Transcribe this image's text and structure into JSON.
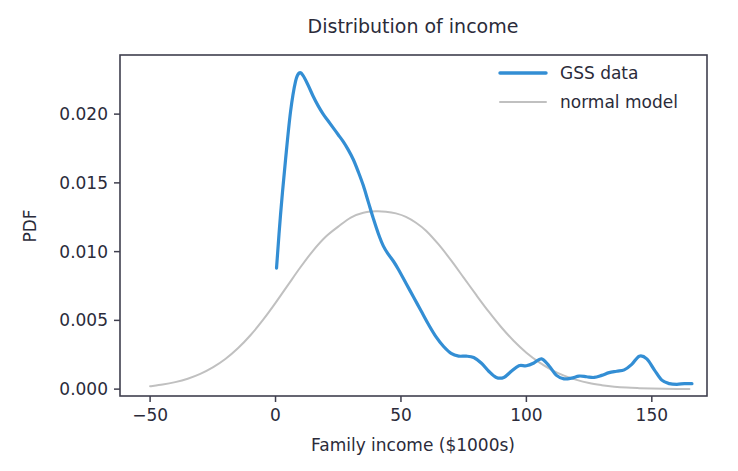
{
  "chart_data": {
    "type": "line",
    "title": "Distribution of income",
    "xlabel": "Family income ($1000s)",
    "ylabel": "PDF",
    "xlim": [
      -62,
      172
    ],
    "ylim": [
      -0.0005,
      0.0243
    ],
    "xticks": [
      -50,
      0,
      50,
      100,
      150
    ],
    "xticklabels": [
      "−50",
      "0",
      "50",
      "100",
      "150"
    ],
    "yticks": [
      0.0,
      0.005,
      0.01,
      0.015,
      0.02
    ],
    "yticklabels": [
      "0.000",
      "0.005",
      "0.010",
      "0.015",
      "0.020"
    ],
    "grid": false,
    "legend_position": "upper right",
    "series": [
      {
        "name": "GSS data",
        "color": "#338ed4",
        "linewidth": 3.2,
        "x": [
          0.4,
          2,
          4,
          6,
          8,
          9.5,
          11,
          13,
          15,
          17,
          19,
          21,
          23,
          25,
          27,
          29,
          31,
          33,
          35,
          37,
          39,
          41,
          43,
          45,
          47,
          49,
          52,
          55,
          58,
          61,
          64,
          67,
          70,
          73,
          76,
          79,
          82,
          85,
          88,
          91,
          94,
          97,
          100,
          103,
          106,
          109,
          112,
          115,
          118,
          121,
          124,
          127,
          130,
          133,
          136,
          139,
          142,
          145,
          148,
          151,
          154,
          157,
          160,
          163,
          166
        ],
        "y": [
          0.0088,
          0.0127,
          0.0167,
          0.0202,
          0.0224,
          0.023,
          0.0228,
          0.0221,
          0.0213,
          0.0206,
          0.02,
          0.0195,
          0.019,
          0.0185,
          0.018,
          0.0174,
          0.0167,
          0.0158,
          0.0148,
          0.0136,
          0.0124,
          0.0113,
          0.0104,
          0.0098,
          0.0093,
          0.0087,
          0.0077,
          0.0067,
          0.0057,
          0.0047,
          0.0038,
          0.0031,
          0.0026,
          0.0024,
          0.0024,
          0.0023,
          0.0019,
          0.0013,
          0.00085,
          0.00085,
          0.0013,
          0.0017,
          0.0017,
          0.0019,
          0.0022,
          0.0017,
          0.001,
          0.00075,
          0.0008,
          0.00095,
          0.0009,
          0.00085,
          0.001,
          0.0012,
          0.0013,
          0.0014,
          0.0018,
          0.0024,
          0.0022,
          0.0014,
          0.00065,
          0.0004,
          0.00035,
          0.0004,
          0.0004
        ]
      },
      {
        "name": "normal model",
        "color": "#c0c0c0",
        "linewidth": 2.0,
        "mu": 44.0,
        "sigma": 31.0,
        "peak_y": 0.0129,
        "x": [
          -50,
          -45,
          -40,
          -35,
          -30,
          -25,
          -20,
          -15,
          -10,
          -5,
          0,
          5,
          10,
          15,
          20,
          25,
          30,
          35,
          40,
          44,
          48,
          52,
          56,
          60,
          65,
          70,
          75,
          80,
          85,
          90,
          95,
          100,
          105,
          110,
          115,
          120,
          125,
          130,
          135,
          140,
          145,
          150,
          155,
          160,
          165
        ],
        "y": [
          0.00021,
          0.00033,
          0.00051,
          0.00076,
          0.00111,
          0.00158,
          0.00219,
          0.00297,
          0.00392,
          0.00503,
          0.00627,
          0.00758,
          0.00888,
          0.01008,
          0.01108,
          0.01182,
          0.01248,
          0.01283,
          0.01293,
          0.0129,
          0.01278,
          0.01253,
          0.0121,
          0.01152,
          0.01052,
          0.00936,
          0.00811,
          0.00685,
          0.00563,
          0.0045,
          0.0035,
          0.00265,
          0.00196,
          0.0014,
          0.00098,
          0.00067,
          0.00044,
          0.00029,
          0.00018,
          0.00011,
          7e-05,
          4e-05,
          2e-05,
          1e-05,
          1e-05
        ]
      }
    ]
  },
  "legend": {
    "entries": [
      {
        "label": "GSS data",
        "color": "#338ed4"
      },
      {
        "label": "normal model",
        "color": "#c0c0c0"
      }
    ]
  },
  "axes": {
    "plot_left": 120,
    "plot_right": 707,
    "plot_top": 55,
    "plot_bottom": 396
  }
}
